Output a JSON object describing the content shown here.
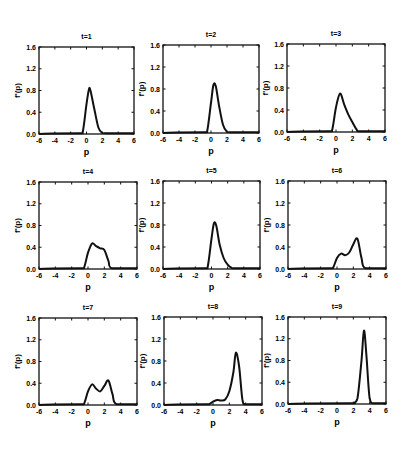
{
  "chart_data": {
    "type": "line",
    "layout": "3x3 grid of small multiples",
    "grid": false,
    "legend": null,
    "xlabel": "p",
    "ylabel": "f'(p)",
    "xlim": [
      -6,
      6
    ],
    "ylim": [
      0,
      1.6
    ],
    "xticks": [
      -6,
      -4,
      -2,
      0,
      2,
      4,
      6
    ],
    "xtick_labels": [
      "-6",
      "-4",
      "-2",
      "0",
      "2",
      "4",
      "6"
    ],
    "yticks": [
      0,
      0.4,
      0.8,
      1.2,
      1.6
    ],
    "ytick_labels": [
      "0.0",
      "0.4",
      "0.8",
      "1.2",
      "1.6"
    ],
    "panels": [
      {
        "title": "t=1",
        "x": [
          -6,
          -1,
          -0.5,
          0,
          0.3,
          0.5,
          1,
          1.5,
          2,
          2.5,
          6
        ],
        "y": [
          0,
          0,
          0.02,
          0.55,
          0.82,
          0.8,
          0.45,
          0.12,
          0.02,
          0,
          0
        ]
      },
      {
        "title": "t=2",
        "x": [
          -6,
          -1,
          -0.5,
          0,
          0.3,
          0.6,
          1,
          1.5,
          2,
          2.5,
          6
        ],
        "y": [
          0,
          0,
          0.02,
          0.55,
          0.87,
          0.85,
          0.5,
          0.15,
          0.02,
          0,
          0
        ]
      },
      {
        "title": "t=3",
        "x": [
          -6,
          -1,
          -0.5,
          0,
          0.5,
          1,
          1.5,
          2,
          2.5,
          3,
          6
        ],
        "y": [
          0,
          0,
          0.02,
          0.45,
          0.7,
          0.5,
          0.32,
          0.18,
          0.05,
          0,
          0
        ]
      },
      {
        "title": "t=4",
        "x": [
          -6,
          -1,
          -0.5,
          0,
          0.5,
          1,
          1.5,
          2,
          2.5,
          3,
          6
        ],
        "y": [
          0,
          0,
          0.02,
          0.3,
          0.47,
          0.42,
          0.38,
          0.35,
          0.15,
          0,
          0
        ]
      },
      {
        "title": "t=5",
        "x": [
          -6,
          -1,
          -0.5,
          0,
          0.3,
          0.6,
          1,
          1.5,
          2,
          2.5,
          3,
          6
        ],
        "y": [
          0,
          0,
          0.02,
          0.55,
          0.83,
          0.78,
          0.45,
          0.2,
          0.08,
          0.02,
          0,
          0
        ]
      },
      {
        "title": "t=6",
        "x": [
          -6,
          -1,
          -0.5,
          0,
          0.5,
          1,
          1.5,
          2,
          2.5,
          3,
          3.5,
          6
        ],
        "y": [
          0,
          0,
          0.02,
          0.2,
          0.28,
          0.25,
          0.3,
          0.45,
          0.55,
          0.2,
          0,
          0
        ]
      },
      {
        "title": "t=7",
        "x": [
          -6,
          -1,
          -0.5,
          0,
          0.5,
          1,
          1.5,
          2,
          2.5,
          3,
          3.5,
          6
        ],
        "y": [
          0,
          0,
          0.02,
          0.25,
          0.38,
          0.3,
          0.25,
          0.35,
          0.45,
          0.2,
          0,
          0
        ]
      },
      {
        "title": "t=8",
        "x": [
          -6,
          -1,
          -0.5,
          0,
          0.5,
          1,
          1.5,
          2,
          2.5,
          2.8,
          3.2,
          3.6,
          4,
          6
        ],
        "y": [
          0,
          0,
          0.01,
          0.06,
          0.09,
          0.08,
          0.1,
          0.25,
          0.6,
          0.95,
          0.7,
          0.1,
          0,
          0
        ]
      },
      {
        "title": "t=9",
        "x": [
          -6,
          1.5,
          2,
          2.5,
          3,
          3.3,
          3.6,
          4,
          4.5,
          6
        ],
        "y": [
          0,
          0,
          0.01,
          0.1,
          0.8,
          1.35,
          0.9,
          0.1,
          0,
          0
        ]
      }
    ]
  },
  "panels": [
    {
      "title": "t=1",
      "box": [
        39,
        47,
        95,
        87
      ]
    },
    {
      "title": "t=2",
      "box": [
        163,
        45,
        96,
        88
      ]
    },
    {
      "title": "t=3",
      "box": [
        287,
        44,
        98,
        88
      ]
    },
    {
      "title": "t=4",
      "box": [
        39,
        182,
        98,
        87
      ]
    },
    {
      "title": "t=5",
      "box": [
        163,
        181,
        97,
        88
      ]
    },
    {
      "title": "t=6",
      "box": [
        288,
        181,
        98,
        88
      ]
    },
    {
      "title": "t=7",
      "box": [
        39,
        318,
        98,
        87
      ]
    },
    {
      "title": "t=8",
      "box": [
        164,
        317,
        98,
        88
      ]
    },
    {
      "title": "t=9",
      "box": [
        288,
        317,
        98,
        87
      ]
    }
  ],
  "colors": {
    "line": "#111111",
    "axes": "#111111",
    "background": "#ffffff"
  }
}
